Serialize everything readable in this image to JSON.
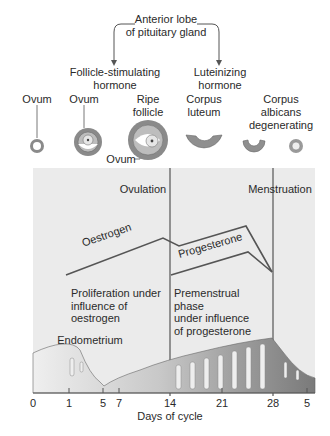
{
  "pituitary": {
    "source_line1": "Anterior lobe",
    "source_line2": "of pituitary gland",
    "fsh_line1": "Follicle-stimulating",
    "fsh_line2": "hormone",
    "lh_line1": "Luteinizing",
    "lh_line2": "hormone"
  },
  "ovary_stages": [
    {
      "line1": "Ovum",
      "line2": ""
    },
    {
      "line1": "Ovum",
      "line2": ""
    },
    {
      "line1": "Ripe",
      "line2": "follicle"
    },
    {
      "line1": "Corpus",
      "line2": "luteum"
    },
    {
      "line1": "Corpus",
      "line2": "albicans",
      "line3": "degenerating"
    }
  ],
  "ovum_callout": "Ovum",
  "events": {
    "ovulation": "Ovulation",
    "menstruation": "Menstruation"
  },
  "hormones": {
    "oestrogen": "Oestrogen",
    "progesterone": "Progesterone"
  },
  "phases": {
    "proliferation": "Proliferation under\ninfluence of\noestrogen",
    "premenstrual": "Premenstrual phase\nunder influence\nof progesterone"
  },
  "endometrium_label": "Endometrium",
  "axis": {
    "ticks": [
      "0",
      "1",
      "5",
      "7",
      "14",
      "21",
      "28",
      "5"
    ],
    "label": "Days of cycle"
  },
  "colors": {
    "panel_bg": "#ebebeb",
    "line": "#555555",
    "tissue_light": "#d4d4d4",
    "tissue_mid": "#a8a8a8",
    "tissue_dark": "#7a7a7a"
  }
}
